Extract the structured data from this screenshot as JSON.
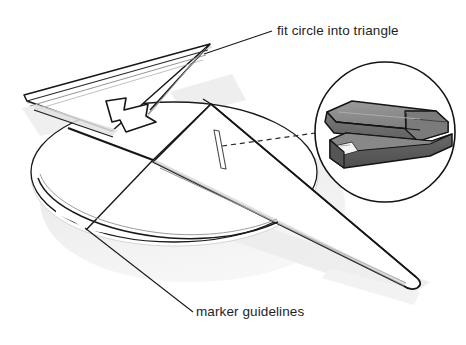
{
  "illustration": {
    "kind": "origami-folding-diagram",
    "description": "Line-art instructional drawing of a folded paper airplane form over a circle guideline, with a magnified stapler inset",
    "background_color": "#ffffff"
  },
  "annotations": {
    "fit_circle_into_triangle": {
      "label": "fit circle into triangle",
      "leader": "diagonal-line-to-triangle-tip"
    },
    "marker_guidelines": {
      "label": "marker guidelines",
      "leader": "diagonal-line-to-circle-arc"
    }
  },
  "inset": {
    "name": "stapler-detail-inset",
    "shape": "circle",
    "connector": "dashed-line",
    "subject": "stapler",
    "colors": {
      "body_top": "#8e8e8e",
      "body_side": "#6f6f6f",
      "base": "#595959",
      "anvil_plate": "#f2f2f2",
      "outline": "#141414",
      "circle_border": "#141414"
    }
  },
  "figure": {
    "arrow": {
      "name": "fold-direction-arrow",
      "direction": "down-right"
    },
    "staple_marker": {
      "name": "staple-position-marker",
      "shape": "thin-vertical-parallelogram"
    },
    "circle_guide": {
      "name": "circle-guideline",
      "shape": "ellipse-arc"
    }
  },
  "colors": {
    "ink": "#141414",
    "paper": "#ffffff",
    "shadow": "#e9e9e9",
    "shadow_soft": "#f1f1f1",
    "fold_shade": "#d8d8d8",
    "edge_gray": "#9a9a9a",
    "text": "#1e1e1e"
  }
}
